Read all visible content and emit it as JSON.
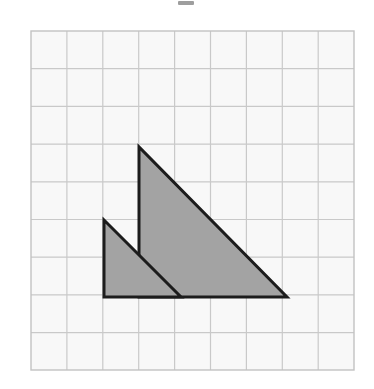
{
  "page": {
    "title": "Two shaded right triangles on a square grid",
    "width": 374,
    "height": 389,
    "background_color": "#ffffff"
  },
  "artifact": {
    "name": "scan-speck-mark",
    "description": "small dark speck near top center of scan",
    "x": 178,
    "y": 1,
    "width": 16,
    "height": 4,
    "color": "#8d8d8d"
  },
  "grid": {
    "origin_x": 31,
    "origin_y": 31,
    "columns": 9,
    "rows": 9,
    "cell_width": 35.9,
    "cell_height": 37.7,
    "right_edge": 354,
    "bottom_edge": 370,
    "line_color": "#c9c9c9",
    "border_color": "#c2c2c2",
    "background_color": "#f8f8f8",
    "line_width": 1.2,
    "border_width": 1.4
  },
  "chart_data": {
    "type": "diagram",
    "title": "Two shaded right triangles on a square grid",
    "grid": {
      "columns": 9,
      "rows": 9,
      "unit_px_x": 35.9,
      "unit_px_y": 37.7,
      "grid_on": true
    },
    "shapes": [
      {
        "name": "large-triangle",
        "kind": "right-triangle",
        "fill": "#a3a3a3",
        "stroke": "#1c1c1c",
        "stroke_width": 3,
        "vertices_px": [
          [
            139,
            147
          ],
          [
            139,
            297
          ],
          [
            287,
            297
          ]
        ],
        "vertices_grid": [
          [
            3,
            3
          ],
          [
            3,
            7
          ],
          [
            7.13,
            7
          ]
        ],
        "legs_units": {
          "vertical": 4,
          "horizontal": 4.13
        },
        "right_angle_at_px": [
          139,
          297
        ]
      },
      {
        "name": "small-triangle",
        "kind": "right-triangle",
        "fill": "#a3a3a3",
        "stroke": "#1c1c1c",
        "stroke_width": 3,
        "vertices_px": [
          [
            104,
            220
          ],
          [
            104,
            297
          ],
          [
            181,
            297
          ]
        ],
        "vertices_grid": [
          [
            2.03,
            5.01
          ],
          [
            2.03,
            7
          ],
          [
            4.18,
            7
          ]
        ],
        "legs_units": {
          "vertical": 2,
          "horizontal": 2.15
        },
        "right_angle_at_px": [
          104,
          297
        ]
      }
    ],
    "shared_baseline_px": {
      "y": 297,
      "x_start": 104,
      "x_end": 287
    },
    "overlap_note": "The small triangle overlaps the lower-left portion of the large triangle; both share the same horizontal baseline.",
    "legend_position": "none",
    "annotations": []
  },
  "colors": {
    "shape_fill": "#a3a3a3",
    "shape_stroke": "#1c1c1c",
    "grid_line": "#c9c9c9",
    "grid_background": "#f8f8f8",
    "page_background": "#ffffff"
  }
}
